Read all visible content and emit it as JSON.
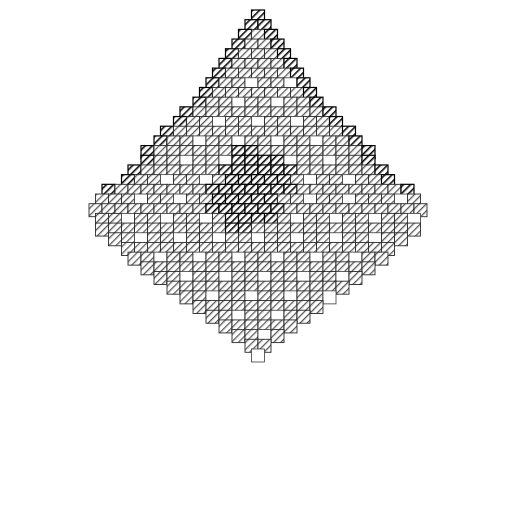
{
  "figure": {
    "title": "",
    "caption": "",
    "kind": "diamond-hatch-lattice",
    "background_color": "#ffffff",
    "canvas": {
      "width": 515,
      "height": 513
    },
    "geometry": {
      "shape": "diamond",
      "top_vertex": {
        "x": 258,
        "y": 10
      },
      "left_vertex": {
        "x": 8,
        "y": 255
      },
      "right_vertex": {
        "x": 502,
        "y": 255
      },
      "bottom_vertex": {
        "x": 262,
        "y": 499
      },
      "cell_size_px": 13,
      "rows_half": 19,
      "grid_rotation_deg": 45
    },
    "cell_styles": {
      "gray": {
        "name": "gray-hatch-cell",
        "fill_color": "#ffffff",
        "hatch_color": "#5a5a5a",
        "stroke_color": "#222222",
        "hatch_direction": "backslash"
      },
      "black": {
        "name": "black-hatch-cell",
        "fill_color": "#ffffff",
        "hatch_color": "#000000",
        "stroke_color": "#000000",
        "hatch_direction": "backslash"
      },
      "white": {
        "name": "empty-cell",
        "fill_color": "#ffffff",
        "hatch_color": "none",
        "stroke_color": "#3c3c3c",
        "hatch_direction": "none"
      }
    },
    "regions": [
      {
        "name": "upper-border-ring",
        "style": "black",
        "description": "Cells hugging the two upper edges of the diamond"
      },
      {
        "name": "upper-body",
        "style": "gray",
        "description": "Gray diagonal hatching filling the upper half interior"
      },
      {
        "name": "central-cluster",
        "style": "black",
        "description": "Small dark diamond of cells at the centre of the figure",
        "bounds": {
          "x": 225,
          "y": 208,
          "width": 66,
          "height": 58
        }
      },
      {
        "name": "lower-body",
        "style": "mixed",
        "description": "Lower half alternates gray hatch and empty cells, fading to white near the bottom vertex"
      },
      {
        "name": "bottom-tip",
        "style": "white",
        "description": "Single empty cell at the lowest vertex"
      }
    ]
  },
  "chart_data": {
    "type": "heatmap",
    "title": "",
    "xlabel": "",
    "ylabel": "",
    "grid": true,
    "legend_position": "none",
    "value_labels": [
      "white",
      "gray",
      "black"
    ],
    "palette": [
      "#ffffff",
      "#5a5a5a",
      "#000000"
    ],
    "cell_size": 13,
    "origin": {
      "x": 258,
      "y": 10
    },
    "note": "Rows are listed from the top vertex downward. Each row string encodes one diagonal rank of cells: '.'=empty/white, 'g'=gray hatch, 'k'=black hatch.",
    "rows": [
      "k",
      "kk",
      "kgk",
      "kggk",
      "kgggk",
      "kggggk",
      "kgggggk",
      "kgg.gg.k",
      "kgggggggk",
      "kgg.gg.ggk",
      "kggggggggggk",
      "kgg.gg.gg.ggk",
      "kgggggggggggggk",
      "kgg.gg.gg.gg.ggk",
      "kggggggkkggggggggk",
      "kgg.gg.kkkk.gg.ggk",
      "kggggggkkkkkkggggggk",
      "kgg.gg.gkkkkkg.gg.ggk",
      "kgggggggkkkkkkkggggggggk",
      "ggg.gg.ggkkkkkgg.gg.ggg.g",
      "gggggggggkkkkkkggggggggggg",
      "gg.gg.gg.gkkkkg.gg.gg.gg.",
      "ggggggggggkkggggggggggggg",
      "gg.gg.gg.gg.gg.gg.gg.gg",
      "ggggggggggggggggggggg",
      "gg.gg.gg.gg.gg.gg.gg",
      "gggggggggggggggggg",
      "gg.gg.gg.gg.gg.g",
      "gggggggggggggg",
      "gg.gg.gg.gg.",
      "gggggggggg",
      "gg.gg.gg",
      "gggggg",
      "gg.g",
      "gg",
      "."
    ]
  }
}
